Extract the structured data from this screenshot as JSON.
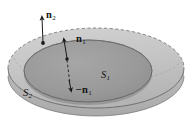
{
  "figure": {
    "type": "geometry-diagram",
    "background_color": "#ffffff",
    "labels": {
      "n2": {
        "symbol": "n",
        "subscript": "2",
        "text": "n2"
      },
      "n1": {
        "symbol": "n",
        "subscript": "1",
        "text": "n1"
      },
      "minus_n1": {
        "symbol": "−n",
        "subscript": "1",
        "text": "-n1"
      },
      "S1": {
        "symbol": "S",
        "subscript": "1",
        "text": "S1"
      },
      "S2": {
        "symbol": "S",
        "subscript": "2",
        "text": "S2"
      }
    },
    "colors": {
      "outer_surface_fill": "#b9b9b9",
      "outer_surface_top_fill": "#c6c6c6",
      "inner_surface_fill": "#9a9a9a",
      "inner_surface_shadow": "#8d8d8d",
      "outline": "#4a4a4a",
      "arrow": "#1a1a1a",
      "label_text": "#141414"
    },
    "elements": {
      "outer_ellipse": {
        "name": "S2",
        "cx": 96,
        "cy": 70,
        "rx": 88,
        "ry": 40,
        "style": "solid front, dashed back"
      },
      "inner_ellipse": {
        "name": "S1",
        "cx": 88,
        "cy": 71,
        "rx": 64,
        "ry": 31,
        "style": "solid outline, darker fill"
      },
      "arrow_n2": {
        "label": "n2",
        "direction": "up",
        "from_x": 43,
        "from_y": 43,
        "to_x": 42,
        "to_y": 15
      },
      "arrow_n1_up": {
        "label": "n1",
        "direction": "up",
        "from_x": 68,
        "from_y": 60,
        "to_x": 64,
        "to_y": 37
      },
      "arrow_n1_down": {
        "label": "-n1",
        "direction": "down",
        "from_x": 66,
        "from_y": 62,
        "to_x": 70,
        "to_y": 88
      },
      "dashed_connector": {
        "from_x": 66,
        "from_y": 48,
        "to_x": 70,
        "to_y": 86,
        "style": "dashed"
      }
    }
  }
}
